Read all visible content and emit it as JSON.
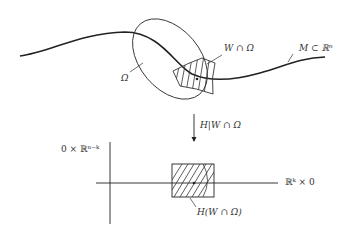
{
  "diagram": {
    "type": "manifold-straightening",
    "colors": {
      "stroke": "#222222",
      "text": "#333333",
      "background": "#ffffff"
    },
    "top": {
      "curve_label": "M ⊂ ℝⁿ",
      "ellipse_label": "Ω",
      "hatched_region_label": "W ∩ Ω"
    },
    "arrow": {
      "label": "H|W ∩ Ω"
    },
    "bottom": {
      "vertical_axis_label": "0 × ℝⁿ⁻ᵏ",
      "horizontal_axis_label": "ℝᵏ × 0",
      "hatched_box_label": "H(W ∩ Ω)"
    }
  }
}
